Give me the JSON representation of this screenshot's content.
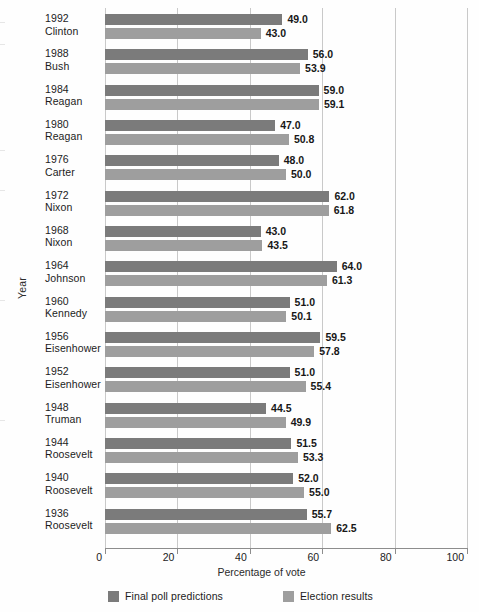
{
  "chart_data": {
    "type": "bar",
    "orientation": "horizontal",
    "title": "",
    "xlabel": "Percentage of vote",
    "ylabel": "Year",
    "xlim": [
      0,
      100
    ],
    "xticks": [
      0,
      20,
      40,
      60,
      80,
      100
    ],
    "xtick_labels": [
      "0",
      "20",
      "40",
      "60",
      "80",
      "100"
    ],
    "grid": true,
    "grid_axis": "x",
    "legend_position": "bottom",
    "categories": [
      {
        "year": "1992",
        "name": "Clinton"
      },
      {
        "year": "1988",
        "name": "Bush"
      },
      {
        "year": "1984",
        "name": "Reagan"
      },
      {
        "year": "1980",
        "name": "Reagan"
      },
      {
        "year": "1976",
        "name": "Carter"
      },
      {
        "year": "1972",
        "name": "Nixon"
      },
      {
        "year": "1968",
        "name": "Nixon"
      },
      {
        "year": "1964",
        "name": "Johnson"
      },
      {
        "year": "1960",
        "name": "Kennedy"
      },
      {
        "year": "1956",
        "name": "Eisenhower"
      },
      {
        "year": "1952",
        "name": "Eisenhower"
      },
      {
        "year": "1948",
        "name": "Truman"
      },
      {
        "year": "1944",
        "name": "Roosevelt"
      },
      {
        "year": "1940",
        "name": "Roosevelt"
      },
      {
        "year": "1936",
        "name": "Roosevelt"
      }
    ],
    "series": [
      {
        "name": "Final poll predictions",
        "color": "#7b7b7b",
        "values": [
          49.0,
          56.0,
          59.0,
          47.0,
          48.0,
          62.0,
          43.0,
          64.0,
          51.0,
          59.5,
          51.0,
          44.5,
          51.5,
          52.0,
          55.7
        ],
        "value_labels": [
          "49.0",
          "56.0",
          "59.0",
          "47.0",
          "48.0",
          "62.0",
          "43.0",
          "64.0",
          "51.0",
          "59.5",
          "51.0",
          "44.5",
          "51.5",
          "52.0",
          "55.7"
        ]
      },
      {
        "name": "Election results",
        "color": "#9e9e9e",
        "values": [
          43.0,
          53.9,
          59.1,
          50.8,
          50.0,
          61.8,
          43.5,
          61.3,
          50.1,
          57.8,
          55.4,
          49.9,
          53.3,
          55.0,
          62.5
        ],
        "value_labels": [
          "43.0",
          "53.9",
          "59.1",
          "50.8",
          "50.0",
          "61.8",
          "43.5",
          "61.3",
          "50.1",
          "57.8",
          "55.4",
          "49.9",
          "53.3",
          "55.0",
          "62.5"
        ]
      }
    ]
  },
  "axes": {
    "x_title": "Percentage of vote",
    "y_title": "Year"
  },
  "legend": {
    "items": [
      {
        "label": "Final poll predictions",
        "color": "#7b7b7b"
      },
      {
        "label": "Election results",
        "color": "#9e9e9e"
      }
    ]
  },
  "colors": {
    "predictions": "#7b7b7b",
    "results": "#9e9e9e",
    "gridline": "#c9c9c9",
    "axis": "#8d8d8d",
    "text": "#1c1c1c",
    "background": "#fefefe"
  }
}
